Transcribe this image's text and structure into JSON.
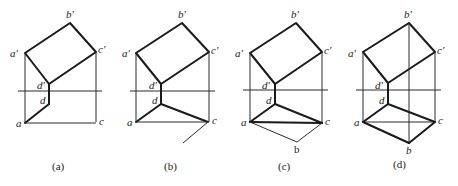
{
  "figure": {
    "panels": [
      {
        "caption": "(a)",
        "labels": {
          "a_prime": "a′",
          "b_prime": "b′",
          "c_prime": "c′",
          "d_prime": "d′",
          "d": "d",
          "a": "a",
          "c": "c"
        }
      },
      {
        "caption": "(b)",
        "labels": {
          "a_prime": "a′",
          "b_prime": "b′",
          "c_prime": "c′",
          "d_prime": "d′",
          "d": "d",
          "a": "a",
          "c": "c"
        }
      },
      {
        "caption": "(c)",
        "labels": {
          "a_prime": "a′",
          "b_prime": "b′",
          "c_prime": "c′",
          "d_prime": "d′",
          "d": "d",
          "a": "a",
          "c": "c",
          "b": "b"
        }
      },
      {
        "caption": "(d)",
        "labels": {
          "a_prime": "a′",
          "b_prime": "b′",
          "c_prime": "c′",
          "d_prime": "d′",
          "d": "d",
          "a": "a",
          "c": "c",
          "b": "b"
        }
      }
    ]
  },
  "colors": {
    "line": "#1a1a1a",
    "background": "#ffffff"
  }
}
